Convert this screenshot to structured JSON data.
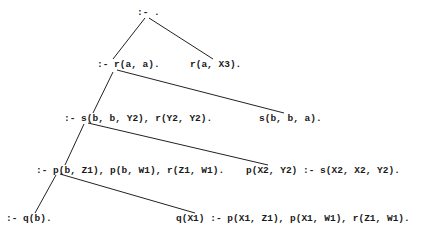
{
  "diagram": {
    "type": "sld-resolution-tree",
    "nodes": [
      {
        "id": "n0",
        "label": ":- .",
        "x": 137,
        "y": 8
      },
      {
        "id": "n1",
        "label": ":- r(a, a).",
        "x": 97,
        "y": 60
      },
      {
        "id": "n2",
        "label": "r(a, X3).",
        "x": 190,
        "y": 60
      },
      {
        "id": "n3",
        "label": ":- s(b, b, Y2), r(Y2, Y2).",
        "x": 64,
        "y": 114
      },
      {
        "id": "n4",
        "label": "s(b, b, a).",
        "x": 259,
        "y": 114
      },
      {
        "id": "n5",
        "label": ":- p(b, Z1), p(b, W1), r(Z1, W1).",
        "x": 36,
        "y": 166
      },
      {
        "id": "n6",
        "label": "p(X2, Y2) :- s(X2, X2, Y2).",
        "x": 246,
        "y": 166
      },
      {
        "id": "n7",
        "label": ":- q(b).",
        "x": 6,
        "y": 214
      },
      {
        "id": "n8",
        "label": "q(X1) :- p(X1, Z1), p(X1, W1), r(Z1, W1).",
        "x": 176,
        "y": 214
      }
    ],
    "edges": [
      {
        "from": "n0",
        "to": "n1",
        "x1": 145,
        "y1": 18,
        "x2": 113,
        "y2": 59
      },
      {
        "from": "n0",
        "to": "n2",
        "x1": 149,
        "y1": 18,
        "x2": 213,
        "y2": 59
      },
      {
        "from": "n1",
        "to": "n3",
        "x1": 113,
        "y1": 72,
        "x2": 93,
        "y2": 113
      },
      {
        "from": "n1",
        "to": "n4",
        "x1": 117,
        "y1": 70,
        "x2": 284,
        "y2": 113
      },
      {
        "from": "n3",
        "to": "n5",
        "x1": 84,
        "y1": 124,
        "x2": 65,
        "y2": 165
      },
      {
        "from": "n3",
        "to": "n6",
        "x1": 88,
        "y1": 123,
        "x2": 268,
        "y2": 165
      },
      {
        "from": "n5",
        "to": "n7",
        "x1": 56,
        "y1": 175,
        "x2": 35,
        "y2": 213
      },
      {
        "from": "n5",
        "to": "n8",
        "x1": 60,
        "y1": 174,
        "x2": 195,
        "y2": 213
      }
    ]
  }
}
